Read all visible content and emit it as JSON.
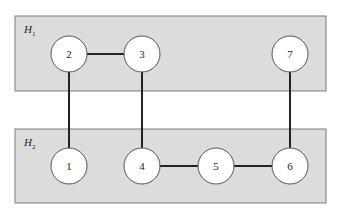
{
  "diagram": {
    "groups": [
      {
        "id": "H1",
        "label": "H",
        "subscript": "1",
        "x": 15,
        "y": 16,
        "w": 311,
        "h": 75
      },
      {
        "id": "H2",
        "label": "H",
        "subscript": "2",
        "x": 15,
        "y": 129,
        "w": 311,
        "h": 74
      }
    ],
    "nodes": [
      {
        "id": "2",
        "label": "2",
        "cx": 69,
        "cy": 54,
        "group": "H1"
      },
      {
        "id": "3",
        "label": "3",
        "cx": 142,
        "cy": 54,
        "group": "H1"
      },
      {
        "id": "7",
        "label": "7",
        "cx": 290,
        "cy": 54,
        "group": "H1"
      },
      {
        "id": "1",
        "label": "1",
        "cx": 69,
        "cy": 166,
        "group": "H2"
      },
      {
        "id": "4",
        "label": "4",
        "cx": 142,
        "cy": 166,
        "group": "H2"
      },
      {
        "id": "5",
        "label": "5",
        "cx": 216,
        "cy": 166,
        "group": "H2"
      },
      {
        "id": "6",
        "label": "6",
        "cx": 290,
        "cy": 166,
        "group": "H2"
      }
    ],
    "edges": [
      {
        "from": "2",
        "to": "3"
      },
      {
        "from": "2",
        "to": "1"
      },
      {
        "from": "3",
        "to": "4"
      },
      {
        "from": "7",
        "to": "6"
      },
      {
        "from": "4",
        "to": "5"
      },
      {
        "from": "5",
        "to": "6"
      }
    ],
    "node_radius": 18
  }
}
